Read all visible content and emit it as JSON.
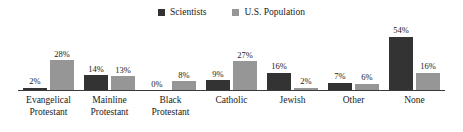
{
  "chart_data": {
    "type": "bar",
    "title": "",
    "subtitle": "",
    "xlabel": "",
    "ylabel": "",
    "ylim": [
      0,
      60
    ],
    "grid": false,
    "legend_position": "top-center",
    "value_label_suffix": "%",
    "categories": [
      "Evangelical\nProtestant",
      "Mainline\nProtestant",
      "Black\nProtestant",
      "Catholic",
      "Jewish",
      "Other",
      "None"
    ],
    "series": [
      {
        "name": "Scientists",
        "color": "#333333",
        "values": [
          2,
          14,
          0,
          9,
          16,
          7,
          54
        ],
        "labels": [
          "2%",
          "14%",
          "0%",
          "9%",
          "16%",
          "7%",
          "54%"
        ]
      },
      {
        "name": "U.S. Population",
        "color": "#969696",
        "values": [
          28,
          13,
          8,
          27,
          2,
          6,
          16
        ],
        "labels": [
          "28%",
          "13%",
          "8%",
          "27%",
          "2%",
          "6%",
          "16%"
        ]
      }
    ]
  },
  "legend": {
    "items": [
      {
        "label": "Scientists",
        "color": "#333333"
      },
      {
        "label": "U.S. Population",
        "color": "#969696"
      }
    ]
  },
  "axis": {
    "baseline_color": "#3a3a3a"
  }
}
